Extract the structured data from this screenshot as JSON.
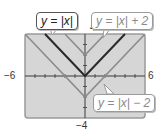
{
  "chart_data": {
    "type": "line",
    "title": "",
    "xlabel": "",
    "ylabel": "",
    "xlim": [
      -6,
      6
    ],
    "ylim": [
      -4,
      4
    ],
    "grid": false,
    "tick_labels": {
      "x_min": "−6",
      "x_max": "6",
      "y_min": "−4",
      "y_max": "4"
    },
    "series": [
      {
        "name": "y = |x|",
        "expr": "abs(x)",
        "color": "#2a2a2a",
        "width": 2,
        "points": [
          [
            -4,
            4
          ],
          [
            0,
            0
          ],
          [
            4,
            4
          ]
        ]
      },
      {
        "name": "y = |x| + 2",
        "expr": "abs(x)+2",
        "color": "#8c8c8c",
        "width": 1.6,
        "points": [
          [
            -2,
            4
          ],
          [
            0,
            2
          ],
          [
            2,
            4
          ]
        ]
      },
      {
        "name": "y = |x| − 2",
        "expr": "abs(x)-2",
        "color": "#8c8c8c",
        "width": 1.6,
        "points": [
          [
            -6,
            4
          ],
          [
            0,
            -2
          ],
          [
            6,
            4
          ]
        ]
      }
    ],
    "annotations": [
      {
        "text": "y = |x|",
        "style": "dark"
      },
      {
        "text": "y = |x| + 2",
        "style": "light"
      },
      {
        "text": "y = |x| − 2",
        "style": "light"
      }
    ]
  },
  "labels": {
    "x_min": "−6",
    "x_max": "6",
    "y_max": "4",
    "y_min": "−4",
    "callout_abs": "y = |x|",
    "callout_plus2": "y = |x| + 2",
    "callout_minus2": "y = |x| − 2"
  },
  "colors": {
    "screen_bg": "#d6d6d6",
    "screen_border": "#9a9a9a",
    "axis": "#3a3a3a",
    "dark_line": "#2a2a2a",
    "light_line": "#8c8c8c"
  }
}
